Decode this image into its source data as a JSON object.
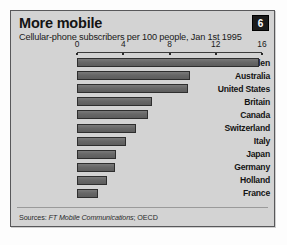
{
  "panel": {
    "badge_label": "6",
    "title": "More mobile",
    "subtitle": "Cellular-phone subscribers per 100 people, Jan 1st 1995",
    "source_prefix": "Sources:",
    "source_italic": "FT Mobile Communications",
    "source_suffix": "; OECD",
    "colors": {
      "panel_bg": "#d3d3d3",
      "panel_border": "#58585a",
      "bar_fill": "#6c6c6c",
      "bar_stroke": "#2e2e2e",
      "badge_bg": "#1b1b1b",
      "text": "#141414"
    }
  },
  "chart_data": {
    "type": "bar",
    "orientation": "horizontal",
    "title": "More mobile",
    "subtitle": "Cellular-phone subscribers per 100 people, Jan 1st 1995",
    "xlabel": "",
    "ylabel": "",
    "xlim": [
      0,
      16
    ],
    "ticks": [
      0,
      4,
      8,
      12,
      16
    ],
    "tick_labels": [
      "0",
      "4",
      "8",
      "12",
      "16"
    ],
    "grid": false,
    "legend": false,
    "axis_position": "top",
    "categories": [
      "Sweden",
      "Australia",
      "United States",
      "Britain",
      "Canada",
      "Switzerland",
      "Italy",
      "Japan",
      "Germany",
      "Holland",
      "France"
    ],
    "values": [
      15.7,
      9.8,
      9.6,
      6.5,
      6.1,
      5.1,
      4.2,
      3.4,
      3.3,
      2.6,
      1.8
    ],
    "source": "Sources: FT Mobile Communications; OECD"
  }
}
